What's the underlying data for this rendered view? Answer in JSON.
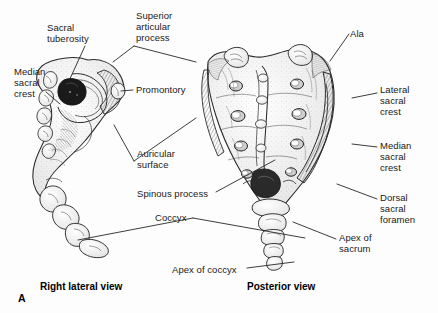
{
  "figure": {
    "panel_letter": "A",
    "background_color": "#fdfdfd",
    "ink_color": "#2b2b2b"
  },
  "captions": [
    {
      "text": "Right lateral view",
      "x": 40,
      "y": 281
    },
    {
      "text": "Posterior view",
      "x": 247,
      "y": 281
    }
  ],
  "labels": [
    {
      "name": "sacral-tuberosity",
      "text": "Sacral\ntuberosity",
      "x": 47,
      "y": 22,
      "align": "left"
    },
    {
      "name": "superior-articular-process",
      "text": "Superior\narticular\nprocess",
      "x": 136,
      "y": 10,
      "align": "left"
    },
    {
      "name": "ala",
      "text": "Ala",
      "x": 350,
      "y": 28,
      "align": "left"
    },
    {
      "name": "median-sacral-crest-left",
      "text": "Median\nsacral\ncrest",
      "x": 14,
      "y": 66,
      "align": "left"
    },
    {
      "name": "promontory",
      "text": "Promontory",
      "x": 136,
      "y": 84,
      "align": "left"
    },
    {
      "name": "lateral-sacral-crest",
      "text": "Lateral\nsacral\ncrest",
      "x": 380,
      "y": 84,
      "align": "left"
    },
    {
      "name": "median-sacral-crest-right",
      "text": "Median\nsacral\ncrest",
      "x": 380,
      "y": 140,
      "align": "left"
    },
    {
      "name": "auricular-surface",
      "text": "Auricular\nsurface",
      "x": 137,
      "y": 148,
      "align": "left"
    },
    {
      "name": "spinous-process",
      "text": "Spinous process",
      "x": 137,
      "y": 188,
      "align": "left"
    },
    {
      "name": "dorsal-sacral-foramen",
      "text": "Dorsal\nsacral\nforamen",
      "x": 380,
      "y": 192,
      "align": "left"
    },
    {
      "name": "coccyx",
      "text": "Coccyx",
      "x": 155,
      "y": 212,
      "align": "left"
    },
    {
      "name": "apex-of-sacrum",
      "text": "Apex of\nsacrum",
      "x": 339,
      "y": 232,
      "align": "left"
    },
    {
      "name": "apex-of-coccyx",
      "text": "Apex of coccyx",
      "x": 172,
      "y": 264,
      "align": "left"
    }
  ],
  "leader_lines": [
    {
      "name": "leader-sacral-tuberosity",
      "points": "85,46 68,83"
    },
    {
      "name": "leader-superior-articular-process-left",
      "points": "134,46 113,62"
    },
    {
      "name": "leader-superior-articular-process-branch",
      "points": "134,46 196,62"
    },
    {
      "name": "leader-median-sacral-crest-left",
      "points": "46,92 60,104"
    },
    {
      "name": "leader-promontory",
      "points": "133,90 121,91"
    },
    {
      "name": "leader-ala",
      "points": "349,34 330,61"
    },
    {
      "name": "leader-lateral-sacral-crest",
      "points": "377,93 352,98"
    },
    {
      "name": "leader-median-sacral-crest-right",
      "points": "377,147 352,144"
    },
    {
      "name": "leader-auricular-surface",
      "points": "134,161 114,125"
    },
    {
      "name": "leader-auricular-surface-branch",
      "points": "134,161 196,118"
    },
    {
      "name": "leader-spinous-process",
      "points": "216,192 275,160"
    },
    {
      "name": "leader-dorsal-sacral-foramen",
      "points": "377,199 337,184"
    },
    {
      "name": "leader-coccyx",
      "points": "193,218 78,240"
    },
    {
      "name": "leader-coccyx-branch",
      "points": "193,218 305,238"
    },
    {
      "name": "leader-apex-of-sacrum",
      "points": "336,239 293,222"
    },
    {
      "name": "leader-apex-of-coccyx",
      "points": "247,268 294,262"
    }
  ]
}
